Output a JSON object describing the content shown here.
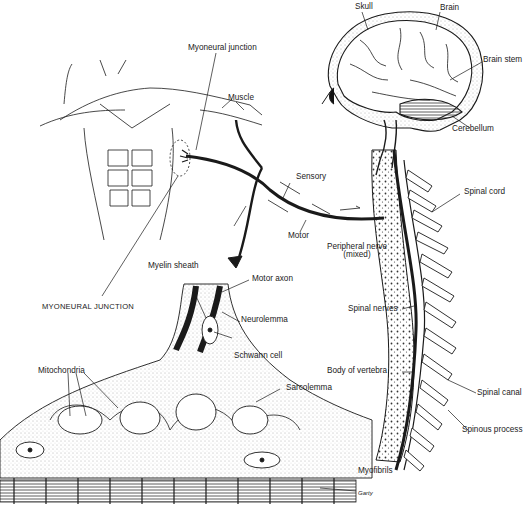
{
  "figure": {
    "labels": {
      "skull": "Skull",
      "brain": "Brain",
      "brain_stem": "Brain stem",
      "cerebellum": "Cerebellum",
      "myoneural_junction": "Myoneural junction",
      "muscle": "Muscle",
      "sensory": "Sensory",
      "motor": "Motor",
      "peripheral_nerve": "Peripheral nerve",
      "peripheral_nerve_sub": "(mixed)",
      "spinal_cord": "Spinal cord",
      "myelin_sheath": "Myelin sheath",
      "motor_axon": "Motor axon",
      "myoneural_junction_caps": "MYONEURAL JUNCTION",
      "neurolemma": "Neurolemma",
      "schwann_cell": "Schwann cell",
      "spinal_nerves": "Spinal nerves",
      "mitochondria": "Mitochondria",
      "body_of_vertebra": "Body of vertebra",
      "spinal_canal": "Spinal canal",
      "sarcolemma": "Sarcolemma",
      "spinous_process": "Spinous process",
      "myofibrils": "Myofibrils",
      "signature": "Garty"
    },
    "colors": {
      "ink": "#1a1a1a",
      "background": "#ffffff",
      "stipple": "#555555"
    }
  }
}
